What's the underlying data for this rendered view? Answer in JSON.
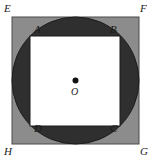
{
  "figure": {
    "background_color": "#ffffff",
    "outer_square": {
      "name": "EFGH",
      "fill_color": "#8c8c8c",
      "stroke_color": "#4a4a4a",
      "x": 12,
      "y": 17,
      "size": 127
    },
    "circle": {
      "fill_color": "#2f2f2f",
      "stroke_color": "#1c1c1c",
      "cx": 75.5,
      "cy": 80.5,
      "r": 63.5
    },
    "inner_square": {
      "name": "ABCD",
      "fill_color": "#ffffff",
      "stroke_color": "#1c1c1c",
      "x": 30,
      "y": 36,
      "size": 90
    },
    "center_point": {
      "label": "O",
      "cx": 75.5,
      "cy": 80.5,
      "r": 3,
      "color": "#111111"
    },
    "labels": {
      "outer": [
        {
          "text": "E",
          "x": 4,
          "y": 12
        },
        {
          "text": "F",
          "x": 140,
          "y": 12
        },
        {
          "text": "G",
          "x": 140,
          "y": 155
        },
        {
          "text": "H",
          "x": 4,
          "y": 155
        }
      ],
      "inner": [
        {
          "text": "A",
          "x": 34,
          "y": 33
        },
        {
          "text": "B",
          "x": 110,
          "y": 33
        },
        {
          "text": "C",
          "x": 110,
          "y": 132
        },
        {
          "text": "D",
          "x": 34,
          "y": 132
        }
      ],
      "center_text": {
        "text": "O",
        "x": 71,
        "y": 95
      }
    }
  }
}
